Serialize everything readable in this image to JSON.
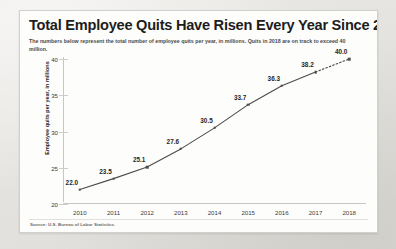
{
  "card": {
    "title": "Total Employee Quits Have Risen Every Year Since 2010",
    "subtitle": "The numbers below represent the total number of employee quits per year, in millions. Quits in 2018 are on track to exceed 40 million.",
    "source": "Source: U.S. Bureau of Labor Statistics."
  },
  "chart_data": {
    "type": "line",
    "title": "Total Employee Quits Have Risen Every Year Since 2010",
    "subtitle": "The numbers below represent the total number of employee quits per year, in millions. Quits in 2018 are on track to exceed 40 million.",
    "xlabel": "",
    "ylabel": "Employee quits per year, in millions",
    "categories": [
      "2010",
      "2011",
      "2012",
      "2013",
      "2014",
      "2015",
      "2016",
      "2017",
      "2018"
    ],
    "values": [
      22.0,
      23.5,
      25.1,
      27.6,
      30.5,
      33.7,
      36.3,
      38.2,
      40.0
    ],
    "point_labels": [
      "22.0",
      "23.5",
      "25.1",
      "27.6",
      "30.5",
      "33.7",
      "36.3",
      "38.2",
      "40.0"
    ],
    "ylim": [
      20,
      40
    ],
    "y_ticks": [
      20,
      25,
      30,
      35,
      40
    ],
    "y_tick_labels": [
      "20",
      "25",
      "30",
      "35",
      "40"
    ],
    "grid": false,
    "legend": "none",
    "projected_from_index": 7,
    "projection_note": "Final segment (2017 to 2018) drawn dotted as a projection",
    "series": [
      {
        "name": "Employee quits per year, in millions",
        "values": [
          22.0,
          23.5,
          25.1,
          27.6,
          30.5,
          33.7,
          36.3,
          38.2,
          40.0
        ],
        "color": "#4c4c4a",
        "marker": "square"
      }
    ],
    "line_color": "#4c4c4a",
    "source": "Source: U.S. Bureau of Labor Statistics."
  }
}
